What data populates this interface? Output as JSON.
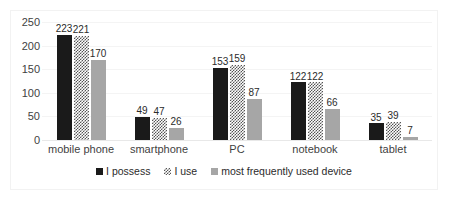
{
  "chart_data": {
    "type": "bar",
    "title": "",
    "subtitle": "",
    "xlabel": "",
    "ylabel": "",
    "ylim": [
      0,
      250
    ],
    "yticks": [
      0,
      50,
      100,
      150,
      200,
      250
    ],
    "grid": true,
    "legend_position": "bottom",
    "categories": [
      "mobile phone",
      "smartphone",
      "PC",
      "notebook",
      "tablet"
    ],
    "series": [
      {
        "name": "I possess",
        "color": "#1a1a1a",
        "pattern": "solid",
        "values": [
          223,
          49,
          153,
          122,
          35
        ]
      },
      {
        "name": "I use",
        "color": "#555555",
        "pattern": "checker",
        "values": [
          221,
          47,
          159,
          122,
          39
        ]
      },
      {
        "name": "most frequently used device",
        "color": "#a6a6a6",
        "pattern": "solid",
        "values": [
          170,
          26,
          87,
          66,
          7
        ]
      }
    ]
  },
  "colors": {
    "series_1": "#1a1a1a",
    "series_2": "#555555",
    "series_3": "#a6a6a6",
    "gridline": "#f4f4f4",
    "frame": "#f2f2f2",
    "text": "#3f3f3f",
    "background": "#ffffff"
  }
}
